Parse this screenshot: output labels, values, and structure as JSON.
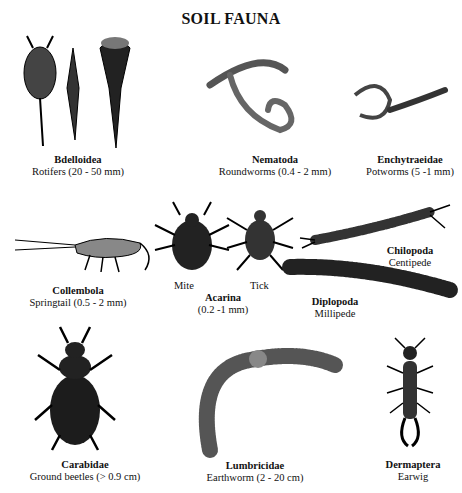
{
  "title": "SOIL FAUNA",
  "organisms": [
    {
      "id": "bdelloidea",
      "scientific": "Bdelloidea",
      "common": "Rotifers  (20 - 50 mm)"
    },
    {
      "id": "nematoda",
      "scientific": "Nematoda",
      "common": "Roundworms (0.4 - 2 mm)"
    },
    {
      "id": "enchytraeidae",
      "scientific": "Enchytraeidae",
      "common": "Potworms (5 -1 mm)"
    },
    {
      "id": "collembola",
      "scientific": "Collembola",
      "common": "Springtail (0.5 - 2 mm)"
    },
    {
      "id": "acarina",
      "scientific": "Acarina",
      "common": "(0.2 -1 mm)",
      "sublabels": [
        "Mite",
        "Tick"
      ]
    },
    {
      "id": "chilopoda",
      "scientific": "Chilopoda",
      "common": "Centipede"
    },
    {
      "id": "diplopoda",
      "scientific": "Diplopoda",
      "common": "Millipede"
    },
    {
      "id": "carabidae",
      "scientific": "Carabidae",
      "common": "Ground beetles (> 0.9 cm)"
    },
    {
      "id": "lumbricidae",
      "scientific": "Lumbricidae",
      "common": "Earthworm (2 - 20 cm)"
    },
    {
      "id": "dermaptera",
      "scientific": "Dermaptera",
      "common": "Earwig"
    }
  ]
}
